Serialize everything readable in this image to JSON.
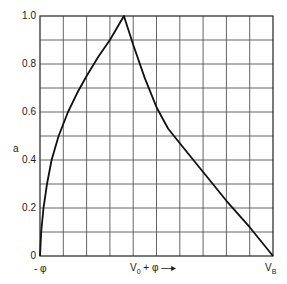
{
  "chart_data": {
    "type": "line",
    "title": "",
    "xlabel": "V0 + φ →",
    "ylabel": "a",
    "x_tick_labels": [
      "-φ",
      "V0 + φ →",
      "VB"
    ],
    "y_tick_labels": [
      "0",
      "0.2",
      "0.4",
      "0.6",
      "0.8",
      "1.0"
    ],
    "ylim": [
      0,
      1.0
    ],
    "xlim": [
      0,
      10
    ],
    "grid": true,
    "grid_divisions": {
      "x": 10,
      "y": 10
    },
    "legend": null,
    "series": [
      {
        "name": "a",
        "x": [
          0,
          0.05,
          0.15,
          0.3,
          0.5,
          0.8,
          1.2,
          1.6,
          2.0,
          2.5,
          3.0,
          3.6,
          4.0,
          4.5,
          5.0,
          5.5,
          6.0,
          7.0,
          8.0,
          9.0,
          10.0
        ],
        "y": [
          0,
          0.1,
          0.2,
          0.3,
          0.4,
          0.5,
          0.6,
          0.68,
          0.75,
          0.83,
          0.9,
          1.0,
          0.88,
          0.74,
          0.62,
          0.53,
          0.47,
          0.35,
          0.23,
          0.12,
          0
        ]
      }
    ]
  },
  "labels": {
    "y_axis": "a",
    "y0": "0",
    "y02": "0.2",
    "y04": "0.4",
    "y06": "0.6",
    "y08": "0.8",
    "y10": "1.0",
    "x_left": "- φ",
    "x_mid": "V",
    "x_mid_sub": "0",
    "x_mid_rest": " + φ —▸",
    "x_right": "V",
    "x_right_sub": "B"
  }
}
